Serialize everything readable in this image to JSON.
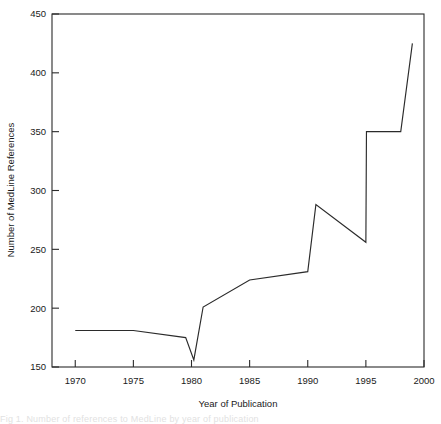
{
  "figure": {
    "background_color": "#ffffff",
    "line_color": "#2b2b2b",
    "axis_color": "#2b2b2b",
    "caption_partial": "Fig 1. Number of references to MedLine by year of publication"
  },
  "chart_data": {
    "type": "line",
    "title": "",
    "xlabel": "Year of Publication",
    "ylabel": "Number of MedLine References",
    "xlim": [
      1968,
      2000
    ],
    "ylim": [
      150,
      450
    ],
    "xticks": [
      1970,
      1975,
      1980,
      1985,
      1990,
      1995,
      2000
    ],
    "yticks": [
      150,
      200,
      250,
      300,
      350,
      400,
      450
    ],
    "xtick_labels": [
      "1970",
      "1975",
      "1980",
      "1985",
      "1990",
      "1995",
      "2000"
    ],
    "ytick_labels": [
      "150",
      "200",
      "250",
      "300",
      "350",
      "400",
      "450"
    ],
    "grid": false,
    "legend": false,
    "series": [
      {
        "name": "MedLine References",
        "x": [
          1970,
          1975,
          1979.5,
          1980.2,
          1981,
          1985,
          1990,
          1990.7,
          1995,
          1995.05,
          1998,
          1999
        ],
        "values": [
          181,
          181,
          175,
          156,
          201,
          224,
          231,
          288,
          256,
          350,
          350,
          425
        ]
      }
    ]
  }
}
